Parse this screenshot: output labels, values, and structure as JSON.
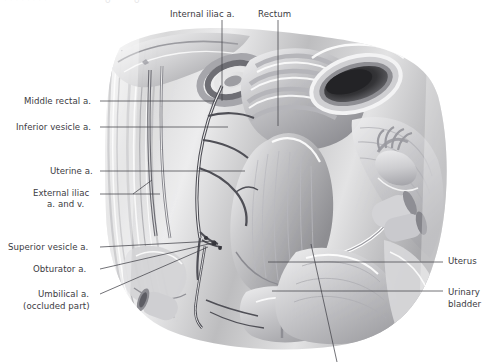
{
  "figure": {
    "style": "grayscale medical illustration",
    "width": 493,
    "height": 362,
    "background_color": "#ffffff",
    "label_color": "#3b3b42",
    "leader_color": "#43434a"
  },
  "top_strip": {
    "fragment_left": "· · · · · · · ·",
    "fragment_mid_a": "o",
    "fragment_mid_b": "o"
  },
  "labels": {
    "internal_iliac": {
      "text": "Internal iliac a.",
      "x": 170,
      "y": 9,
      "align": "left"
    },
    "rectum": {
      "text": "Rectum",
      "x": 258,
      "y": 9,
      "align": "left"
    },
    "middle_rectal": {
      "text": "Middle rectal a.",
      "x": 24,
      "y": 97,
      "align": "left"
    },
    "inferior_vesicle": {
      "text": "Inferior vesicle a.",
      "x": 16,
      "y": 123,
      "align": "left"
    },
    "uterine": {
      "text": "Uterine a.",
      "x": 50,
      "y": 167,
      "align": "left"
    },
    "external_iliac_line1": {
      "text": "External iliac",
      "x": 33,
      "y": 189,
      "align": "left"
    },
    "external_iliac_line2": {
      "text": "a. and v.",
      "x": 47,
      "y": 200,
      "align": "left"
    },
    "superior_vesicle": {
      "text": "Superior vesicle a.",
      "x": 8,
      "y": 243,
      "align": "left"
    },
    "obturator": {
      "text": "Obturator a.",
      "x": 33,
      "y": 265,
      "align": "left"
    },
    "umbilical_line1": {
      "text": "Umbilical a.",
      "x": 38,
      "y": 290,
      "align": "left"
    },
    "umbilical_line2": {
      "text": "(occluded part)",
      "x": 23,
      "y": 302,
      "align": "left"
    },
    "uterus": {
      "text": "Uterus",
      "x": 448,
      "y": 256,
      "align": "left"
    },
    "urinary_bladder_line1": {
      "text": "Urinary",
      "x": 448,
      "y": 288,
      "align": "left"
    },
    "urinary_bladder_line2": {
      "text": "bladder",
      "x": 448,
      "y": 300,
      "align": "left"
    }
  },
  "leaders": [
    {
      "name": "internal-iliac-leader",
      "d": "M 222 20 L 222 101"
    },
    {
      "name": "rectum-leader",
      "d": "M 278 20 L 278 126"
    },
    {
      "name": "middle-rectal-leader",
      "d": "M 100 101 L 215 101"
    },
    {
      "name": "inferior-vesicle-leader",
      "d": "M 100 127 L 228 127"
    },
    {
      "name": "uterine-leader",
      "d": "M 100 171 L 245 171"
    },
    {
      "name": "external-iliac-leader",
      "d": "M 100 194 L 160 194"
    },
    {
      "name": "external-iliac-branch",
      "d": "M 133 194 L 152 180"
    },
    {
      "name": "superior-vesicle-leader",
      "d": "M 100 247 L 215 241"
    },
    {
      "name": "obturator-leader",
      "d": "M 100 269 L 213 243"
    },
    {
      "name": "umbilical-leader",
      "d": "M 100 294 L 208 247"
    },
    {
      "name": "uterus-leader",
      "d": "M 268 262 L 443 262"
    },
    {
      "name": "bladder-leader",
      "d": "M 272 291 L 443 291"
    },
    {
      "name": "unlabeled-vagina-leader",
      "d": "M 311 244 L 337 362"
    }
  ],
  "legend": {
    "note": "Grayscale anatomical plate — no legend, no axes, no numeric data"
  }
}
